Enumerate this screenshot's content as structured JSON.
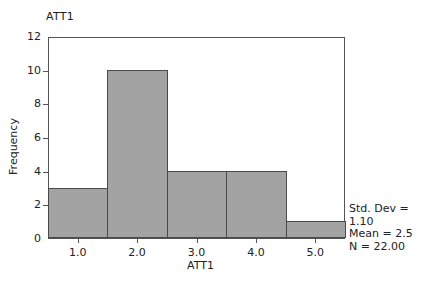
{
  "chart_data": {
    "type": "bar",
    "title": "ATT1",
    "xlabel": "ATT1",
    "ylabel": "Frequency",
    "categories": [
      "1.0",
      "2.0",
      "3.0",
      "4.0",
      "5.0"
    ],
    "values": [
      3,
      10,
      4,
      4,
      1
    ],
    "ylim": [
      0,
      12
    ],
    "yticks": [
      "0",
      "2",
      "4",
      "6",
      "8",
      "10",
      "12"
    ],
    "grid": false,
    "stats": {
      "std_dev": "Std. Dev = 1.10",
      "mean": "Mean = 2.5",
      "n": "N = 22.00"
    }
  }
}
